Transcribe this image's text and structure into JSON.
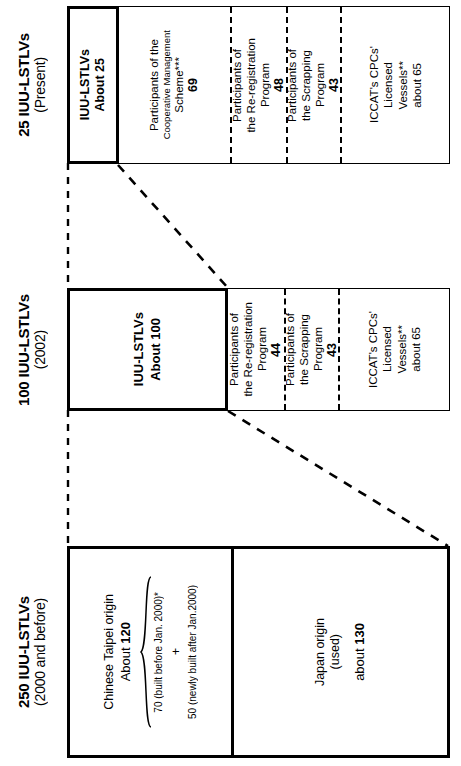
{
  "figure": {
    "type": "flow-diagram",
    "orientation": "rotated-90-ccw"
  },
  "sections": [
    {
      "id": "present",
      "header_line1": "25 IUU-LSTLVs",
      "header_line2": "(Present)",
      "total_box": {
        "label": "IUU-LSTLVs",
        "value": "About 25"
      },
      "cells": [
        {
          "name": "cooperative-management-scheme",
          "lines": [
            "Participants of the"
          ],
          "small_lines": [
            "Cooperative Management"
          ],
          "tail_lines": [
            "Scheme***"
          ],
          "value": "69"
        },
        {
          "name": "re-registration-program",
          "lines": [
            "Participants of",
            "the Re-registration",
            "Program"
          ],
          "value": "48"
        },
        {
          "name": "scrapping-program",
          "lines": [
            "Participants of",
            "the Scrapping",
            "Program"
          ],
          "value": "43"
        },
        {
          "name": "iccat-licensed-vessels",
          "lines": [
            "ICCAT's CPCs'",
            "Licensed",
            "Vessels**"
          ],
          "value": "about 65"
        }
      ]
    },
    {
      "id": "y2002",
      "header_line1": "100 IUU-LSTLVs",
      "header_line2": "(2002)",
      "total_box": {
        "label": "IUU-LSTLVs",
        "value": "About 100"
      },
      "cells": [
        {
          "name": "re-registration-program",
          "lines": [
            "Participants of",
            "the Re-registration",
            "Program"
          ],
          "value": "44"
        },
        {
          "name": "scrapping-program",
          "lines": [
            "Participants of",
            "the Scrapping",
            "Program"
          ],
          "value": "43"
        },
        {
          "name": "iccat-licensed-vessels",
          "lines": [
            "ICCAT's CPCs'",
            "Licensed",
            "Vessels**"
          ],
          "value": "about 65"
        }
      ]
    },
    {
      "id": "y2000",
      "header_line1": "250 IUU-LSTLVs",
      "header_line2": "(2000 and before)",
      "cells": [
        {
          "name": "chinese-taipei-origin",
          "lines": [
            "Chinese Taipei origin"
          ],
          "value_prefix": "About ",
          "value": "120",
          "brace": {
            "item1": "70 (built before Jan. 2000)*",
            "plus": "+",
            "item2": "50 (newly built after Jan.2000)"
          }
        },
        {
          "name": "japan-origin",
          "lines": [
            "Japan origin",
            "(used)"
          ],
          "value_prefix": "about ",
          "value": "130"
        }
      ]
    }
  ],
  "colors": {
    "ink": "#000000",
    "paper": "#ffffff"
  }
}
